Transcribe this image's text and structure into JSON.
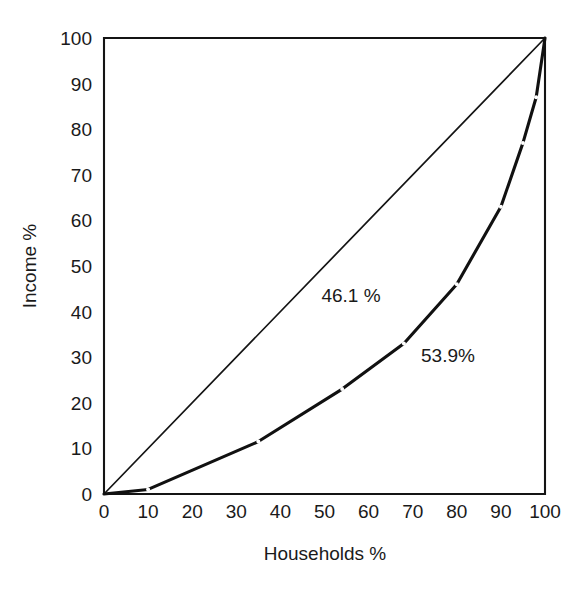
{
  "chart_data": {
    "type": "line",
    "title": "",
    "subtitle": "",
    "xlabel": "Households %",
    "ylabel": "Income %",
    "xlim": [
      0,
      100
    ],
    "ylim": [
      0,
      100
    ],
    "grid": false,
    "legend": "none",
    "x_ticks": [
      "0",
      "10",
      "20",
      "30",
      "40",
      "50",
      "60",
      "70",
      "80",
      "90",
      "100"
    ],
    "y_ticks": [
      "0",
      "10",
      "20",
      "30",
      "40",
      "50",
      "60",
      "70",
      "80",
      "90",
      "100"
    ],
    "x_tick_values": [
      0,
      10,
      20,
      30,
      40,
      50,
      60,
      70,
      80,
      90,
      100
    ],
    "y_tick_values": [
      0,
      10,
      20,
      30,
      40,
      50,
      60,
      70,
      80,
      90,
      100
    ],
    "series": [
      {
        "name": "line-of-equality",
        "style": "thin-solid",
        "x": [
          0,
          100
        ],
        "y": [
          0,
          100
        ]
      },
      {
        "name": "lorenz-curve",
        "style": "thick-solid-with-markers",
        "x": [
          0,
          10,
          35,
          54,
          68,
          80,
          90,
          95,
          98,
          100
        ],
        "y": [
          0,
          1,
          11.5,
          23,
          33,
          46,
          63,
          77,
          87,
          100
        ]
      }
    ],
    "annotations": [
      {
        "name": "area-above-curve",
        "text": "46.1 %",
        "x": 56,
        "y": 42
      },
      {
        "name": "area-below-curve",
        "text": "53.9%",
        "x": 78,
        "y": 29
      }
    ]
  },
  "axes": {
    "x_axis_label": "Households %",
    "y_axis_label": "Income %"
  }
}
